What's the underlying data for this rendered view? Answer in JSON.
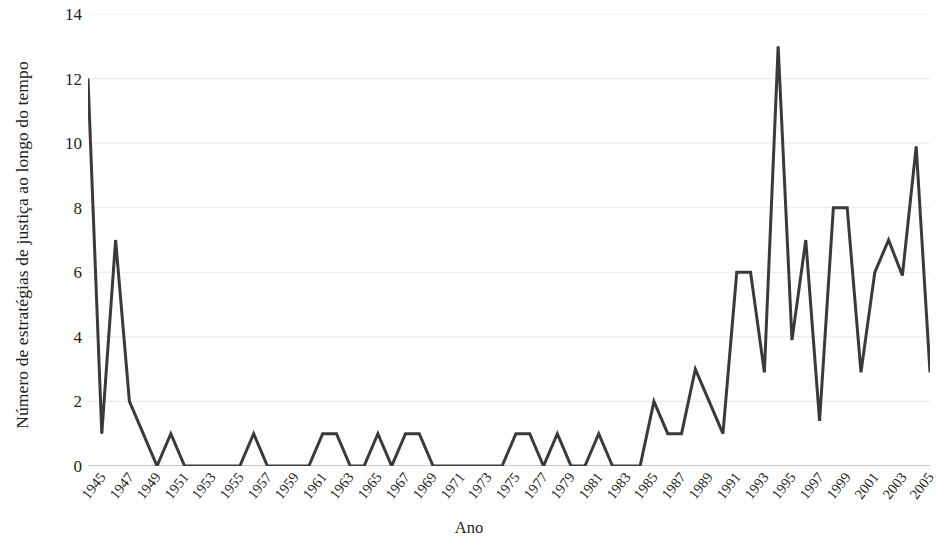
{
  "chart_data": {
    "type": "line",
    "title": "",
    "xlabel": "Ano",
    "ylabel": "Número de estratégias de justiça ao longo do tempo",
    "xlim": [
      1945,
      2006
    ],
    "ylim": [
      0,
      14
    ],
    "yticks": [
      0,
      2,
      4,
      6,
      8,
      10,
      12,
      14
    ],
    "xticks": [
      1945,
      1947,
      1949,
      1951,
      1953,
      1955,
      1957,
      1959,
      1961,
      1963,
      1965,
      1967,
      1969,
      1971,
      1973,
      1975,
      1977,
      1979,
      1981,
      1983,
      1985,
      1987,
      1989,
      1991,
      1993,
      1995,
      1997,
      1999,
      2001,
      2003,
      2005
    ],
    "xtick_labels": [
      "1945",
      "1947",
      "1949",
      "1951",
      "1953",
      "1955",
      "1957",
      "1959",
      "1961",
      "1963",
      "1965",
      "1967",
      "1969",
      "1971",
      "1973",
      "1975",
      "1977",
      "1979",
      "1981",
      "1983",
      "1985",
      "1987",
      "1989",
      "1991",
      "1993",
      "1995",
      "1997",
      "1999",
      "2001",
      "2003",
      "2005"
    ],
    "ytick_labels": [
      "0",
      "2",
      "4",
      "6",
      "8",
      "10",
      "12",
      "14"
    ],
    "grid": "horizontal",
    "legend": "none",
    "line_color": "#3a3a3a",
    "line_width": 3,
    "x": [
      1945,
      1946,
      1947,
      1948,
      1949,
      1950,
      1951,
      1952,
      1953,
      1954,
      1955,
      1956,
      1957,
      1958,
      1959,
      1960,
      1961,
      1962,
      1963,
      1964,
      1965,
      1966,
      1967,
      1968,
      1969,
      1970,
      1971,
      1972,
      1973,
      1974,
      1975,
      1976,
      1977,
      1978,
      1979,
      1980,
      1981,
      1982,
      1983,
      1984,
      1985,
      1986,
      1987,
      1988,
      1989,
      1990,
      1991,
      1992,
      1993,
      1994,
      1995,
      1996,
      1997,
      1998,
      1999,
      2000,
      2001,
      2002,
      2003,
      2004,
      2005,
      2006
    ],
    "values": [
      12,
      1,
      7,
      2,
      1,
      0,
      1,
      0,
      0,
      0,
      0,
      0,
      1,
      0,
      0,
      0,
      0,
      1,
      1,
      0,
      0,
      1,
      0,
      1,
      1,
      0,
      0,
      0,
      0,
      0,
      0,
      1,
      1,
      0,
      1,
      0,
      0,
      1,
      0,
      0,
      0,
      2,
      1,
      1,
      3,
      2,
      1,
      6,
      6,
      2.9,
      13,
      3.9,
      7,
      1.4,
      8,
      8,
      2.9,
      6,
      7,
      5.9,
      9.9,
      2.9
    ],
    "series": [
      {
        "name": "Estratégias de justiça",
        "values": [
          12,
          1,
          7,
          2,
          1,
          0,
          1,
          0,
          0,
          0,
          0,
          0,
          1,
          0,
          0,
          0,
          0,
          1,
          1,
          0,
          0,
          1,
          0,
          1,
          1,
          0,
          0,
          0,
          0,
          0,
          0,
          1,
          1,
          0,
          1,
          0,
          0,
          1,
          0,
          0,
          0,
          2,
          1,
          1,
          3,
          2,
          1,
          6,
          6,
          2.9,
          13,
          3.9,
          7,
          1.4,
          8,
          8,
          2.9,
          6,
          7,
          5.9,
          9.9,
          2.9
        ]
      }
    ]
  },
  "colors": {
    "line": "#3a3a3a",
    "axis": "#8c8c8c",
    "grid": "#e9e9e9",
    "text": "#231f20",
    "background": "#ffffff"
  }
}
